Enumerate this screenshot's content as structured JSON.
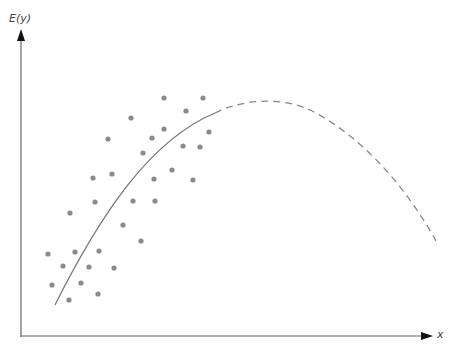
{
  "diagram": {
    "y_axis_label": "E(y)",
    "x_axis_label": "x",
    "colors": {
      "axis": "#666666",
      "arrow": "#111111",
      "points": "#8a8a8a",
      "curve": "#777777",
      "background": "#ffffff"
    },
    "fitted_curve": {
      "solid_segment": "M55,305 C100,215 150,140 215,113",
      "dashed_segment": "M215,113 C240,100 280,96 310,110 C360,135 405,185 436,241"
    },
    "points": [
      [
        164,
        98
      ],
      [
        203,
        98
      ],
      [
        186,
        111
      ],
      [
        131,
        118
      ],
      [
        164,
        129
      ],
      [
        152,
        138
      ],
      [
        209,
        132
      ],
      [
        108,
        139
      ],
      [
        143,
        153
      ],
      [
        183,
        146
      ],
      [
        200,
        147
      ],
      [
        93,
        178
      ],
      [
        112,
        174
      ],
      [
        172,
        170
      ],
      [
        154,
        179
      ],
      [
        193,
        180
      ],
      [
        95,
        202
      ],
      [
        133,
        201
      ],
      [
        155,
        201
      ],
      [
        70,
        213
      ],
      [
        123,
        225
      ],
      [
        141,
        241
      ],
      [
        48,
        254
      ],
      [
        75,
        252
      ],
      [
        99,
        251
      ],
      [
        63,
        266
      ],
      [
        89,
        267
      ],
      [
        114,
        268
      ],
      [
        52,
        285
      ],
      [
        81,
        283
      ],
      [
        69,
        300
      ],
      [
        98,
        294
      ]
    ]
  }
}
